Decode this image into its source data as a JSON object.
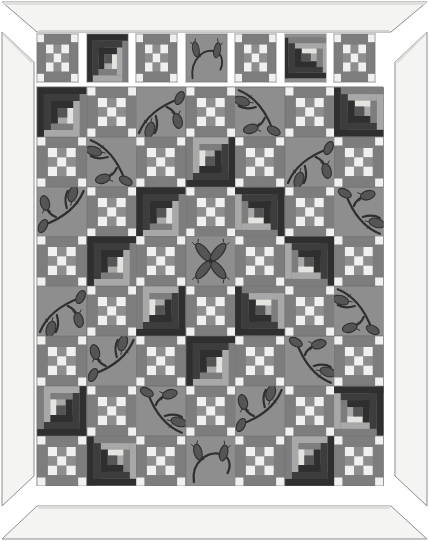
{
  "artwork": {
    "title": "Framed Log Cabin & Nine-Patch Sampler Quilt",
    "medium": "pieced and applique quilt illustration",
    "orientation": "portrait"
  },
  "frame": {
    "style": "beveled mat frame",
    "face_color": "#f2f2f0",
    "bevel_color": "#dedede",
    "edge_color": "#9a9a9a",
    "pieces": [
      {
        "name": "frame-top",
        "label": "top rail"
      },
      {
        "name": "frame-right",
        "label": "right stile"
      },
      {
        "name": "frame-bottom",
        "label": "bottom rail"
      },
      {
        "name": "frame-left",
        "label": "left stile"
      }
    ]
  },
  "palette": {
    "background_gray": "#8e8e8e",
    "medium_gray": "#7d7d7d",
    "light": "#f0f0ee",
    "cream": "#e3e3e0",
    "dark": "#2f2f2f",
    "dark_alt": "#3d3d3d",
    "mid_dark": "#555555",
    "light_mid": "#a8a8a8"
  },
  "block_types": {
    "nine_patch": "nine-patch block",
    "log_cabin": "log cabin block",
    "applique_tulip": "applique tulip vine block",
    "applique_flower": "applique four-petal flower block",
    "applique_arc": "applique arched stem with two buds"
  },
  "sampler_row": {
    "label": "top sampler strip",
    "count": 7,
    "blocks": [
      {
        "type": "nine_patch",
        "variant": "a"
      },
      {
        "type": "log_cabin",
        "rotation": 180
      },
      {
        "type": "nine_patch",
        "variant": "a"
      },
      {
        "type": "applique_arc",
        "rotation": 0
      },
      {
        "type": "nine_patch",
        "variant": "a"
      },
      {
        "type": "log_cabin",
        "rotation": 90
      },
      {
        "type": "nine_patch",
        "variant": "a"
      }
    ]
  },
  "quilt_grid": {
    "columns": 7,
    "rows": 8,
    "cell_label": "quilt block cell",
    "layout": [
      [
        "log_cabin:180",
        "nine_patch",
        "applique_tulip:0",
        "nine_patch",
        "applique_tulip:1",
        "nine_patch",
        "log_cabin:90"
      ],
      [
        "nine_patch",
        "applique_tulip:1",
        "nine_patch",
        "log_cabin:0",
        "nine_patch",
        "applique_tulip:0",
        "nine_patch"
      ],
      [
        "applique_tulip:2",
        "nine_patch",
        "log_cabin:180",
        "nine_patch",
        "log_cabin:270",
        "nine_patch",
        "applique_tulip:3"
      ],
      [
        "nine_patch",
        "log_cabin:180",
        "nine_patch",
        "applique_flower",
        "nine_patch",
        "log_cabin:270",
        "nine_patch"
      ],
      [
        "applique_tulip:0",
        "nine_patch",
        "log_cabin:0",
        "nine_patch",
        "log_cabin:90",
        "nine_patch",
        "applique_tulip:1"
      ],
      [
        "nine_patch",
        "applique_tulip:2",
        "nine_patch",
        "log_cabin:180",
        "nine_patch",
        "applique_tulip:3",
        "nine_patch"
      ],
      [
        "log_cabin:0",
        "nine_patch",
        "applique_tulip:3",
        "nine_patch",
        "applique_tulip:2",
        "nine_patch",
        "log_cabin:270"
      ],
      [
        "nine_patch",
        "log_cabin:90",
        "nine_patch",
        "applique_arc",
        "nine_patch",
        "log_cabin:0",
        "nine_patch"
      ]
    ]
  }
}
